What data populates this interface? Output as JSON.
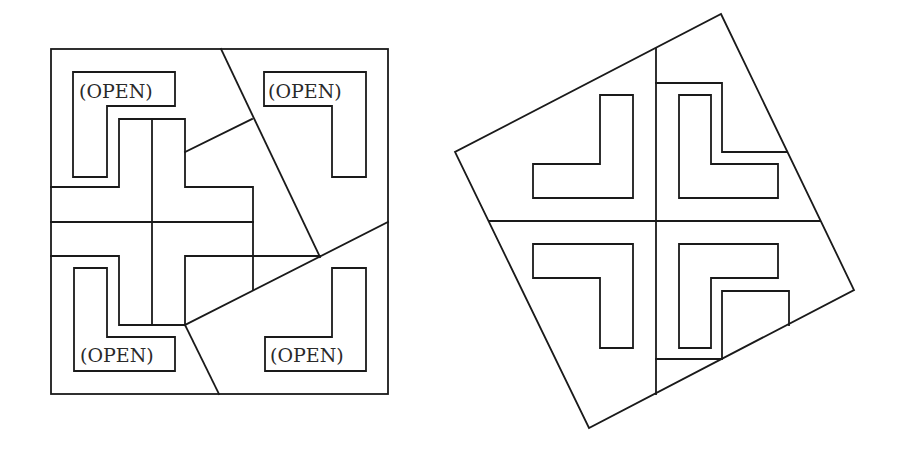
{
  "figure": {
    "type": "dissection-puzzle",
    "panels": [
      {
        "id": "left",
        "description": "Square with a central cross and four L-shaped open regions, dissected into pieces",
        "labels": [
          {
            "position": "top-left",
            "text": "(OPEN)"
          },
          {
            "position": "top-right",
            "text": "(OPEN)"
          },
          {
            "position": "bottom-left",
            "text": "(OPEN)"
          },
          {
            "position": "bottom-right",
            "text": "(OPEN)"
          }
        ]
      },
      {
        "id": "right",
        "description": "Rotated square reassembled from pieces, showing four L-shaped holes"
      }
    ]
  },
  "colors": {
    "stroke": "#1a1a1a",
    "background": "#ffffff"
  }
}
